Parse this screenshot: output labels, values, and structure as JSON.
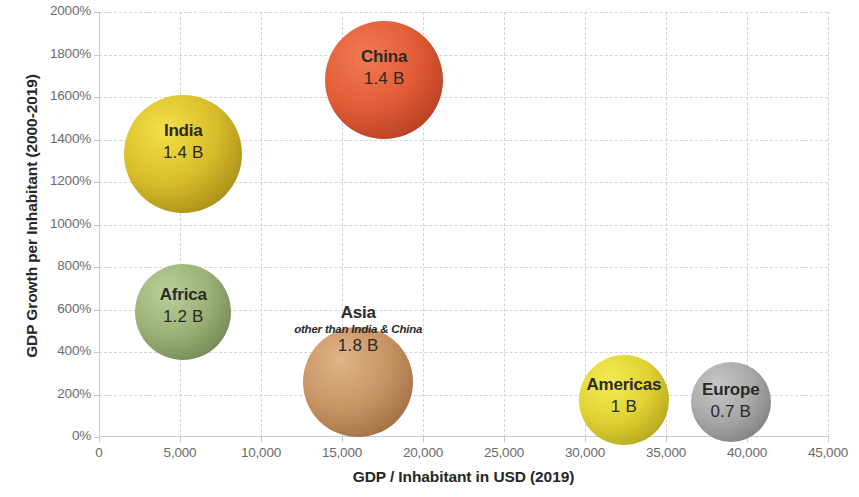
{
  "chart_data": {
    "type": "scatter",
    "title": "",
    "xlabel": "GDP / Inhabitant in USD (2019)",
    "ylabel": "GDP Growth per Inhabitant (2000-2019)",
    "xlim": [
      0,
      45000
    ],
    "ylim": [
      0,
      2000
    ],
    "x_ticks": [
      "0",
      "5,000",
      "10,000",
      "15,000",
      "20,000",
      "25,000",
      "30,000",
      "35,000",
      "40,000",
      "45,000"
    ],
    "x_tick_values": [
      0,
      5000,
      10000,
      15000,
      20000,
      25000,
      30000,
      35000,
      40000,
      45000
    ],
    "y_ticks": [
      "0%",
      "200%",
      "400%",
      "600%",
      "800%",
      "1000%",
      "1200%",
      "1400%",
      "1600%",
      "1800%",
      "2000%"
    ],
    "y_tick_values": [
      0,
      200,
      400,
      600,
      800,
      1000,
      1200,
      1400,
      1600,
      1800,
      2000
    ],
    "grid": true,
    "legend": "none",
    "size_unit": "population in billions",
    "bubbles": [
      {
        "name": "India",
        "subtitle": "",
        "value_label": "1.4 B",
        "population_billions": 1.4,
        "x": 5200,
        "y": 1330,
        "diameter_px": 118,
        "color_light": "#f2e04a",
        "color_mid": "#d9bd2a",
        "color_dark": "#8e7410"
      },
      {
        "name": "China",
        "subtitle": "",
        "value_label": "1.4 B",
        "population_billions": 1.4,
        "x": 17600,
        "y": 1680,
        "diameter_px": 118,
        "color_light": "#f07a50",
        "color_mid": "#e25c36",
        "color_dark": "#9e3018"
      },
      {
        "name": "Africa",
        "subtitle": "",
        "value_label": "1.2 B",
        "population_billions": 1.2,
        "x": 5200,
        "y": 590,
        "diameter_px": 96,
        "color_light": "#bcd09a",
        "color_mid": "#9bb177",
        "color_dark": "#5f7442"
      },
      {
        "name": "Asia",
        "subtitle": "other than India & China",
        "value_label": "1.8 B",
        "population_billions": 1.8,
        "x": 16000,
        "y": 260,
        "diameter_px": 110,
        "color_light": "#e0b487",
        "color_mid": "#c99464",
        "color_dark": "#8a5c31"
      },
      {
        "name": "Americas",
        "subtitle": "",
        "value_label": "1 B",
        "population_billions": 1.0,
        "x": 32400,
        "y": 175,
        "diameter_px": 90,
        "color_light": "#f4ec55",
        "color_mid": "#e0d232",
        "color_dark": "#9d8f12"
      },
      {
        "name": "Europe",
        "subtitle": "",
        "value_label": "0.7 B",
        "population_billions": 0.7,
        "x": 39000,
        "y": 165,
        "diameter_px": 80,
        "color_light": "#c8c8c8",
        "color_mid": "#a8a8a8",
        "color_dark": "#6d6d6d"
      }
    ]
  }
}
